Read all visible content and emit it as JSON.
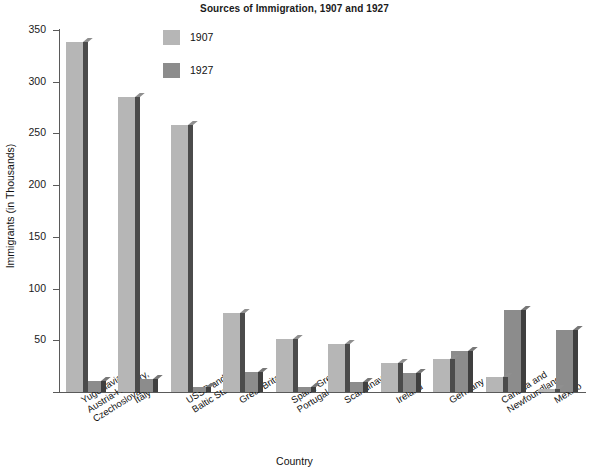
{
  "chart_data": {
    "type": "bar",
    "title": "Sources of Immigration, 1907 and 1927",
    "xlabel": "Country",
    "ylabel": "Immigrants (in Thousands)",
    "ylim": [
      0,
      350
    ],
    "yticks": [
      0,
      50,
      100,
      150,
      200,
      250,
      300,
      350
    ],
    "ytick_labels": [
      "",
      "50",
      "100",
      "150",
      "200",
      "250",
      "300",
      "350"
    ],
    "grid": false,
    "legend_position": "upper-center",
    "categories": [
      "Yugoslavia,\nAustria-Hungary,\nCzechoslovakia",
      "Italy",
      "USSR and\nBaltic States",
      "Great Britain",
      "Spain, Greece,\nPortugal",
      "Scandinavia",
      "Ireland",
      "Germany",
      "Canada and\nNewfoundland",
      "Mexico"
    ],
    "series": [
      {
        "name": "1907",
        "color": "#b6b6b6",
        "values": [
          338,
          285,
          258,
          76,
          51,
          46,
          28,
          32,
          15,
          3
        ]
      },
      {
        "name": "1927",
        "color": "#8c8c8c",
        "values": [
          11,
          13,
          5,
          19,
          5,
          10,
          18,
          40,
          79,
          60
        ]
      }
    ]
  },
  "legend": {
    "items": [
      {
        "label": "1907",
        "color": "#b6b6b6"
      },
      {
        "label": "1927",
        "color": "#8c8c8c"
      }
    ]
  },
  "axes": {
    "y_title": "Immigrants (in Thousands)",
    "x_title": "Country"
  }
}
